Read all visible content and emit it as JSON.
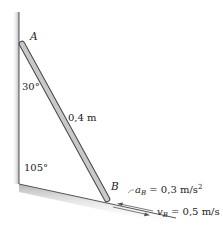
{
  "diagram": {
    "points": {
      "A": {
        "label": "A"
      },
      "B": {
        "label": "B"
      }
    },
    "angles": {
      "top": "30°",
      "corner": "105°"
    },
    "rod": {
      "length_label": "0,4 m"
    },
    "annotations": {
      "acceleration": {
        "symbol": "a",
        "subscript": "B",
        "value": "= 0,3 m/s",
        "superscript": "2"
      },
      "velocity": {
        "symbol": "v",
        "subscript": "B",
        "value": "= 0,5 m/s"
      }
    },
    "colors": {
      "rod_fill": "#c8c8c8",
      "rod_edge": "#444444",
      "surface": "#555555",
      "shadow": "#cfcfcf"
    }
  }
}
